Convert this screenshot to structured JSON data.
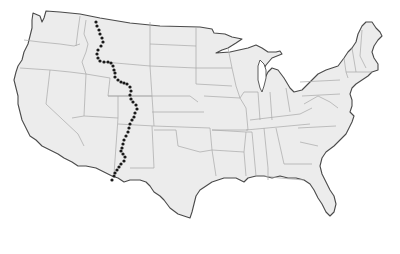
{
  "map": {
    "subject": "Contiguous United States",
    "style": "grayscale outline map with state borders",
    "colors": {
      "background": "#ffffff",
      "land_fill": "#ececec",
      "coastline": "#4a4a4a",
      "state_borders": "#a8a8a8",
      "dotted_line": "#1a1a1a"
    },
    "overlay": {
      "name": "Continental Divide",
      "style": "dotted line",
      "path_points": [
        [
          96,
          22
        ],
        [
          97,
          26
        ],
        [
          99,
          30
        ],
        [
          100,
          34
        ],
        [
          102,
          38
        ],
        [
          103,
          42
        ],
        [
          101,
          46
        ],
        [
          98,
          50
        ],
        [
          97,
          54
        ],
        [
          98,
          58
        ],
        [
          100,
          61
        ],
        [
          104,
          62
        ],
        [
          108,
          62
        ],
        [
          111,
          63
        ],
        [
          113,
          66
        ],
        [
          114,
          70
        ],
        [
          115,
          73
        ],
        [
          115,
          77
        ],
        [
          118,
          80
        ],
        [
          121,
          82
        ],
        [
          124,
          83
        ],
        [
          127,
          84
        ],
        [
          130,
          87
        ],
        [
          131,
          91
        ],
        [
          130,
          95
        ],
        [
          131,
          99
        ],
        [
          133,
          102
        ],
        [
          136,
          105
        ],
        [
          137,
          109
        ],
        [
          135,
          113
        ],
        [
          134,
          117
        ],
        [
          132,
          120
        ],
        [
          130,
          124
        ],
        [
          129,
          128
        ],
        [
          128,
          132
        ],
        [
          126,
          136
        ],
        [
          124,
          140
        ],
        [
          123,
          144
        ],
        [
          122,
          148
        ],
        [
          121,
          151
        ],
        [
          123,
          154
        ],
        [
          125,
          157
        ],
        [
          124,
          161
        ],
        [
          121,
          164
        ],
        [
          119,
          167
        ],
        [
          117,
          170
        ],
        [
          115,
          173
        ],
        [
          114,
          176
        ],
        [
          112,
          180
        ]
      ]
    }
  }
}
